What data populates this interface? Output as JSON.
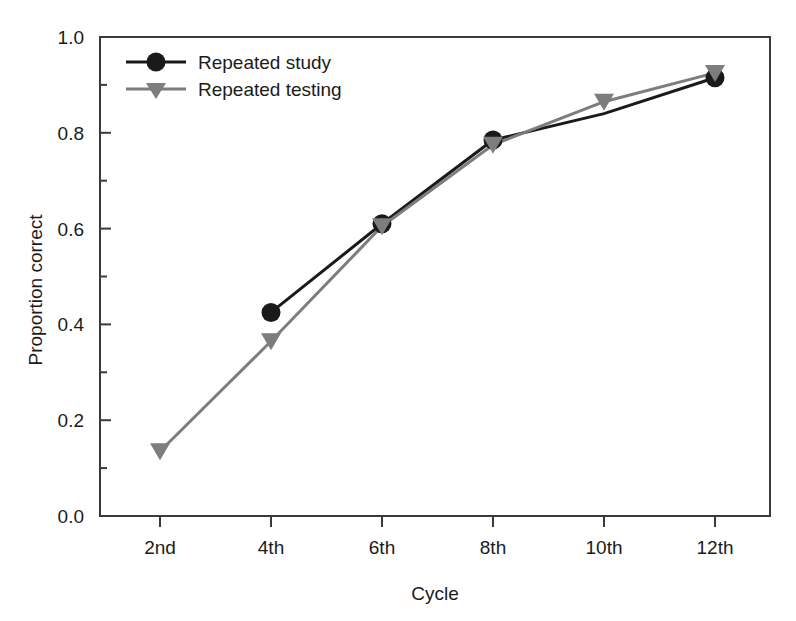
{
  "chart_data": {
    "type": "line",
    "title": "",
    "xlabel": "Cycle",
    "ylabel": "Proportion correct",
    "categories": [
      "2nd",
      "4th",
      "6th",
      "8th",
      "10th",
      "12th"
    ],
    "x": [
      2,
      4,
      6,
      8,
      10,
      12
    ],
    "ylim": [
      0.0,
      1.0
    ],
    "ytick_labels": [
      "0.0",
      "0.2",
      "0.4",
      "0.6",
      "0.8",
      "1.0"
    ],
    "ytick_values": [
      0.0,
      0.2,
      0.4,
      0.6,
      0.8,
      1.0
    ],
    "yminor_values": [
      0.1,
      0.3,
      0.5,
      0.7,
      0.9
    ],
    "grid": false,
    "legend_position": "top-left",
    "series": [
      {
        "name": "Repeated study",
        "color": "#1a1a1a",
        "marker": "circle",
        "values": [
          null,
          0.425,
          0.61,
          0.785,
          0.84,
          0.915
        ],
        "marker_visible": [
          false,
          true,
          true,
          true,
          false,
          true
        ]
      },
      {
        "name": "Repeated testing",
        "color": "#7d7d7d",
        "marker": "triangle-down",
        "values": [
          0.135,
          0.365,
          0.605,
          0.775,
          0.865,
          0.925
        ],
        "marker_visible": [
          true,
          true,
          true,
          true,
          true,
          true
        ]
      }
    ]
  },
  "axis": {
    "y_title": "Proportion correct",
    "x_title": "Cycle"
  },
  "legend": {
    "items": [
      {
        "label": "Repeated study"
      },
      {
        "label": "Repeated testing"
      }
    ]
  },
  "ticks": {
    "y": [
      "1.0",
      "0.8",
      "0.6",
      "0.4",
      "0.2",
      "0.0"
    ],
    "x": [
      "2nd",
      "4th",
      "6th",
      "8th",
      "10th",
      "12th"
    ]
  }
}
